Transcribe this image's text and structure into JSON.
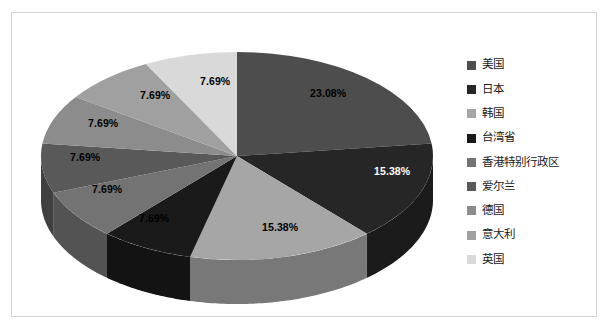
{
  "chart_data": {
    "type": "pie",
    "title": "",
    "subtitle": "",
    "xlabel": "",
    "ylabel": "",
    "legend_position": "right",
    "grid": false,
    "three_d": true,
    "categories": [
      "美国",
      "日本",
      "韩国",
      "台湾省",
      "香港特别行政区",
      "爱尔兰",
      "德国",
      "意大利",
      "英国"
    ],
    "values": [
      23.08,
      15.38,
      15.38,
      7.69,
      7.69,
      7.69,
      7.69,
      7.69,
      7.69
    ],
    "labels": [
      "23.08%",
      "15.38%",
      "15.38%",
      "7.69%",
      "7.69%",
      "7.69%",
      "7.69%",
      "7.69%",
      "7.69%"
    ],
    "colors": [
      "#4d4d4d",
      "#262626",
      "#a6a6a6",
      "#1a1a1a",
      "#737373",
      "#595959",
      "#8c8c8c",
      "#a0a0a0",
      "#d9d9d9"
    ],
    "slices": [
      {
        "name": "美国",
        "value": 23.08,
        "label": "23.08%",
        "color": "#4d4d4d"
      },
      {
        "name": "日本",
        "value": 15.38,
        "label": "15.38%",
        "color": "#262626"
      },
      {
        "name": "韩国",
        "value": 15.38,
        "label": "15.38%",
        "color": "#a6a6a6"
      },
      {
        "name": "台湾省",
        "value": 7.69,
        "label": "7.69%",
        "color": "#1a1a1a"
      },
      {
        "name": "香港特别行政区",
        "value": 7.69,
        "label": "7.69%",
        "color": "#737373"
      },
      {
        "name": "爱尔兰",
        "value": 7.69,
        "label": "7.69%",
        "color": "#595959"
      },
      {
        "name": "德国",
        "value": 7.69,
        "label": "7.69%",
        "color": "#8c8c8c"
      },
      {
        "name": "意大利",
        "value": 7.69,
        "label": "7.69%",
        "color": "#a0a0a0"
      },
      {
        "name": "英国",
        "value": 7.69,
        "label": "7.69%",
        "color": "#d9d9d9"
      }
    ]
  },
  "legend": {
    "items": [
      {
        "label": "美国",
        "color": "#4d4d4d"
      },
      {
        "label": "日本",
        "color": "#262626"
      },
      {
        "label": "韩国",
        "color": "#a6a6a6"
      },
      {
        "label": "台湾省",
        "color": "#1a1a1a"
      },
      {
        "label": "香港特别行政区",
        "color": "#737373"
      },
      {
        "label": "爱尔兰",
        "color": "#595959"
      },
      {
        "label": "德国",
        "color": "#8c8c8c"
      },
      {
        "label": "意大利",
        "color": "#a0a0a0"
      },
      {
        "label": "英国",
        "color": "#d9d9d9"
      }
    ]
  },
  "labels_overlay": [
    {
      "text": "23.08%",
      "x": 298,
      "y": 74,
      "light": false
    },
    {
      "text": "15.38%",
      "x": 362,
      "y": 152,
      "light": true
    },
    {
      "text": "15.38%",
      "x": 250,
      "y": 208,
      "light": false
    },
    {
      "text": "7.69%",
      "x": 127,
      "y": 199,
      "light": false
    },
    {
      "text": "7.69%",
      "x": 80,
      "y": 170,
      "light": false
    },
    {
      "text": "7.69%",
      "x": 58,
      "y": 138,
      "light": false
    },
    {
      "text": "7.69%",
      "x": 76,
      "y": 104,
      "light": false
    },
    {
      "text": "7.69%",
      "x": 128,
      "y": 76,
      "light": false
    },
    {
      "text": "7.69%",
      "x": 188,
      "y": 62,
      "light": false
    }
  ]
}
